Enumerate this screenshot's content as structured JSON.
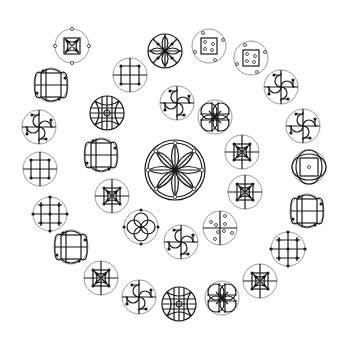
{
  "diagram": {
    "title": "",
    "background": "#ffffff",
    "stroke_color": "#1a1a1a",
    "ring_color": "#8a8a8a",
    "layout": "spiral",
    "center": {
      "glyph": "eight-petal-rosette",
      "x": 175,
      "y": 170,
      "r": 30
    },
    "glyphs": [
      {
        "glyph": "square-petals-dotted-ring",
        "x": 72,
        "y": 46,
        "r": 17
      },
      {
        "glyph": "eight-petal-star",
        "x": 165,
        "y": 51,
        "r": 17
      },
      {
        "glyph": "square-with-dots",
        "x": 209,
        "y": 46,
        "r": 17
      },
      {
        "glyph": "square-with-dots",
        "x": 251,
        "y": 58,
        "r": 17
      },
      {
        "glyph": "pinwheel",
        "x": 281,
        "y": 87,
        "r": 17
      },
      {
        "glyph": "pinwheel",
        "x": 303,
        "y": 126,
        "r": 17
      },
      {
        "glyph": "circle-rect-dot",
        "x": 309,
        "y": 167,
        "r": 17
      },
      {
        "glyph": "rounded-knot",
        "x": 307,
        "y": 211,
        "r": 17
      },
      {
        "glyph": "grid-dots",
        "x": 288,
        "y": 249,
        "r": 17
      },
      {
        "glyph": "square-petals-cross",
        "x": 260,
        "y": 281,
        "r": 17
      },
      {
        "glyph": "flower-lattice",
        "x": 222,
        "y": 298,
        "r": 17
      },
      {
        "glyph": "lattice",
        "x": 179,
        "y": 304,
        "r": 17
      },
      {
        "glyph": "pinwheel",
        "x": 139,
        "y": 297,
        "r": 17
      },
      {
        "glyph": "square-petals-cross",
        "x": 101,
        "y": 278,
        "r": 17
      },
      {
        "glyph": "rounded-knot",
        "x": 71,
        "y": 247,
        "r": 17
      },
      {
        "glyph": "grid-dots",
        "x": 50,
        "y": 214,
        "r": 17
      },
      {
        "glyph": "grid-square",
        "x": 40,
        "y": 169,
        "r": 17
      },
      {
        "glyph": "pinwheel",
        "x": 39,
        "y": 127,
        "r": 17
      },
      {
        "glyph": "rounded-knot",
        "x": 51,
        "y": 85,
        "r": 17
      },
      {
        "glyph": "grid-square",
        "x": 130,
        "y": 75,
        "r": 17
      },
      {
        "glyph": "lattice",
        "x": 107,
        "y": 113,
        "r": 17
      },
      {
        "glyph": "rounded-knot",
        "x": 101,
        "y": 155,
        "r": 17
      },
      {
        "glyph": "square-petals-cross",
        "x": 112,
        "y": 196,
        "r": 17
      },
      {
        "glyph": "four-circle-flower",
        "x": 141,
        "y": 227,
        "r": 17
      },
      {
        "glyph": "pinwheel",
        "x": 181,
        "y": 242,
        "r": 17
      },
      {
        "glyph": "cross-scattered-dots",
        "x": 220,
        "y": 228,
        "r": 17
      },
      {
        "glyph": "square-petals-cross",
        "x": 245,
        "y": 192,
        "r": 17
      },
      {
        "glyph": "square-petals-cross",
        "x": 242,
        "y": 152,
        "r": 17
      },
      {
        "glyph": "flower-lattice",
        "x": 215,
        "y": 117,
        "r": 17
      },
      {
        "glyph": "pinwheel",
        "x": 177,
        "y": 103,
        "r": 17
      }
    ]
  }
}
